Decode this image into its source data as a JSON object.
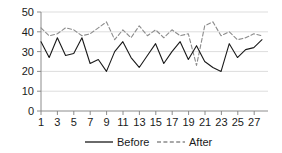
{
  "chart_data": {
    "type": "line",
    "title": "",
    "xlabel": "",
    "ylabel": "",
    "ylim": [
      0,
      50
    ],
    "xlim": [
      1,
      28
    ],
    "grid": true,
    "legend_position": "bottom",
    "y_ticks": [
      "0",
      "10",
      "20",
      "30",
      "40",
      "50"
    ],
    "y_tick_values": [
      0,
      10,
      20,
      30,
      40,
      50
    ],
    "x_ticks": [
      "1",
      "3",
      "5",
      "7",
      "9",
      "11",
      "13",
      "15",
      "17",
      "19",
      "21",
      "23",
      "25",
      "27"
    ],
    "x_tick_values": [
      1,
      3,
      5,
      7,
      9,
      11,
      13,
      15,
      17,
      19,
      21,
      23,
      25,
      27
    ],
    "x": [
      1,
      2,
      3,
      4,
      5,
      6,
      7,
      8,
      9,
      10,
      11,
      12,
      13,
      14,
      15,
      16,
      17,
      18,
      19,
      20,
      21,
      22,
      23,
      24,
      25,
      26,
      27,
      28
    ],
    "series": [
      {
        "name": "Before",
        "style": "solid",
        "color": "#1a1a1a",
        "values": [
          35,
          27,
          37,
          28,
          29,
          37,
          24,
          26,
          20,
          30,
          35,
          27,
          22,
          28,
          34,
          24,
          30,
          35,
          26,
          33,
          25,
          22,
          20,
          34,
          27,
          31,
          32,
          36
        ]
      },
      {
        "name": "After",
        "style": "dashed",
        "color": "#8c8c8c",
        "values": [
          42,
          38,
          39,
          42,
          41,
          38,
          39,
          42,
          45,
          36,
          41,
          37,
          43,
          38,
          41,
          37,
          41,
          38,
          39,
          23,
          43,
          45,
          38,
          40,
          36,
          37,
          39,
          38
        ]
      }
    ],
    "legend": [
      {
        "label": "Before",
        "style": "solid",
        "color": "#1a1a1a"
      },
      {
        "label": "After",
        "style": "dashed",
        "color": "#8c8c8c"
      }
    ]
  }
}
